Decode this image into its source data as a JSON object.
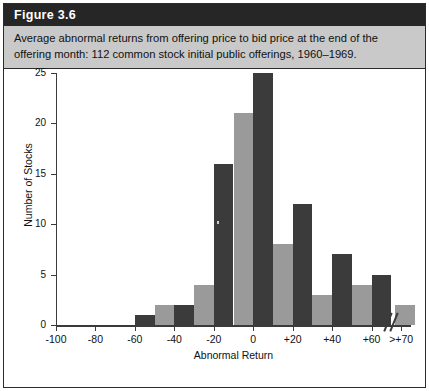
{
  "figure": {
    "label": "Figure 3.6",
    "caption_line1": "Average abnormal returns from offering price to bid price at the end of the",
    "caption_line2": "offering month: 112 common stock initial public offerings, 1960–1969."
  },
  "colors": {
    "header_bg": "#262626",
    "header_text": "#ffffff",
    "caption_bg": "#c9c9c9",
    "frame": "#2b2b2b",
    "bar_dark": "#3b3b3b",
    "bar_light": "#9a9a9a",
    "axis": "#3a3a3a",
    "plot_bg": "#ffffff"
  },
  "chart_data": {
    "type": "bar",
    "title": "",
    "xlabel": "Abnormal Return",
    "ylabel": "Number of Stocks",
    "ylim": [
      0,
      25
    ],
    "ytick_labels": [
      "0",
      "5",
      "10",
      "15",
      "20",
      "25"
    ],
    "yticks": [
      0,
      5,
      10,
      15,
      20,
      25
    ],
    "xtick_labels": [
      "-100",
      "-80",
      "-60",
      "-40",
      "-20",
      "0",
      "+20",
      "+40",
      "+60",
      ">+70"
    ],
    "xticks": [
      -100,
      -80,
      -60,
      -40,
      -20,
      0,
      20,
      40,
      60,
      75
    ],
    "xlim": [
      -100,
      80
    ],
    "grid": false,
    "legend": false,
    "axis_break": true,
    "bin_width": 10,
    "categories": [
      "-60",
      "-50",
      "-40",
      "-30",
      "-20",
      "-10",
      "0",
      "+10",
      "+20",
      "+30",
      "+40",
      "+50",
      "+60",
      ">+70"
    ],
    "bin_starts": [
      -60,
      -50,
      -40,
      -30,
      -20,
      -10,
      0,
      10,
      20,
      30,
      40,
      50,
      60,
      70
    ],
    "values": [
      1,
      2,
      2,
      4,
      16,
      21,
      25,
      8,
      12,
      3,
      7,
      4,
      5,
      2
    ],
    "bar_shades": [
      "dark",
      "light",
      "dark",
      "light",
      "dark",
      "light",
      "dark",
      "light",
      "dark",
      "light",
      "dark",
      "light",
      "dark",
      "light"
    ]
  }
}
